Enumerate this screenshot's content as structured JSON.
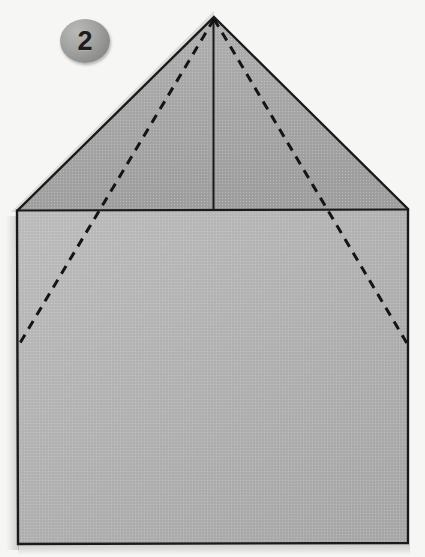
{
  "figure": {
    "step_number": "2",
    "background_color": "#f6f7f5",
    "paper": {
      "roof_fill_color": "#a9a9a9",
      "body_fill_color": "#b4b4b4",
      "outline_color": "#1a1a1a",
      "outline_width": 2.2,
      "crease_color": "#141414",
      "crease_style": "dashed",
      "crease_dash_pattern": "9 7",
      "fold_line_color": "#1a1a1a",
      "shadow_color": "rgba(0,0,0,0.16)"
    },
    "geometry": {
      "apex": [
        214,
        17
      ],
      "roof_left_corner": [
        17,
        211
      ],
      "roof_right_corner": [
        408,
        209
      ],
      "body_bottom_left": [
        18,
        544
      ],
      "body_bottom_right": [
        408,
        543
      ],
      "center_fold_line": {
        "x": 213,
        "y_top": 17,
        "y_bottom": 211
      },
      "horizontal_fold_line": {
        "y": 210,
        "x_left": 17,
        "x_right": 408
      },
      "crease_left": {
        "from": [
          214,
          19
        ],
        "to": [
          17,
          348
        ]
      },
      "crease_right": {
        "from": [
          214,
          19
        ],
        "to": [
          408,
          345
        ]
      }
    },
    "labels": {
      "shape_name": "pentagon-house-paper",
      "roof_region_name": "triangular-roof-flap",
      "body_region_name": "square-body-panel"
    }
  }
}
